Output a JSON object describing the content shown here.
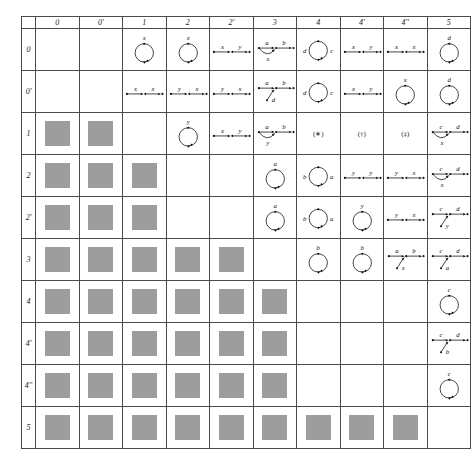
{
  "figure": {
    "kind": "quiver-classification-table",
    "columns": [
      "0",
      "0'",
      "1",
      "2",
      "2'",
      "3",
      "4",
      "4'",
      "4''",
      "5"
    ],
    "rows": [
      "0",
      "0'",
      "1",
      "2",
      "2'",
      "3",
      "4",
      "4'",
      "4''",
      "5"
    ],
    "colors": {
      "blocked": "#9d9d9d",
      "ink": "#111111",
      "rule": "#4b4b4b"
    },
    "legend": {
      "blocked": "gray filled square (no diagram)",
      "loop": "circle with arrowhead and edge label",
      "chain": "horizontal arrow chain with edge labels",
      "chain_arc": "arrow chain with lower arc edge",
      "chain_branch": "arrow chain with diagonal branch edge"
    }
  },
  "cells": {
    "0": {
      "0": {
        "type": "blank"
      },
      "0'": {
        "type": "blank"
      },
      "1": {
        "type": "loop",
        "labels": [
          "x"
        ]
      },
      "2": {
        "type": "loop",
        "labels": [
          "x"
        ]
      },
      "2'": {
        "type": "chain",
        "labels": [
          "x",
          "y"
        ]
      },
      "3": {
        "type": "chain_arc",
        "labels": [
          "a",
          "b"
        ],
        "arc_label": "x"
      },
      "4": {
        "type": "loop_two",
        "labels": [
          "d",
          "c"
        ]
      },
      "4'": {
        "type": "chain",
        "labels": [
          "x",
          "y"
        ]
      },
      "4''": {
        "type": "chain",
        "labels": [
          "x",
          "x"
        ]
      },
      "5": {
        "type": "loop",
        "labels": [
          "d"
        ]
      }
    },
    "0'": {
      "0": {
        "type": "blank"
      },
      "0'": {
        "type": "blank"
      },
      "1": {
        "type": "chain",
        "labels": [
          "x",
          "x"
        ]
      },
      "2": {
        "type": "chain",
        "labels": [
          "y",
          "x"
        ]
      },
      "2'": {
        "type": "chain",
        "labels": [
          "y",
          "x"
        ]
      },
      "3": {
        "type": "chain_branch",
        "labels": [
          "a",
          "b"
        ],
        "branch_label": "d"
      },
      "4": {
        "type": "loop_two",
        "labels": [
          "d",
          "c"
        ]
      },
      "4'": {
        "type": "chain",
        "labels": [
          "x",
          "y"
        ]
      },
      "4''": {
        "type": "loop",
        "labels": [
          "x"
        ]
      },
      "5": {
        "type": "loop",
        "labels": [
          "d"
        ]
      }
    },
    "1": {
      "0": {
        "type": "blocked"
      },
      "0'": {
        "type": "blocked"
      },
      "1": {
        "type": "blank"
      },
      "2": {
        "type": "loop",
        "labels": [
          "y"
        ]
      },
      "2'": {
        "type": "chain",
        "labels": [
          "x",
          "y"
        ]
      },
      "3": {
        "type": "chain_arc",
        "labels": [
          "a",
          "b"
        ],
        "arc_label": "y"
      },
      "4": {
        "type": "marker",
        "text": "(∗)"
      },
      "4'": {
        "type": "marker",
        "text": "(†)"
      },
      "4''": {
        "type": "marker",
        "text": "(‡)"
      },
      "5": {
        "type": "chain_arc",
        "labels": [
          "c",
          "d"
        ],
        "arc_label": "x"
      }
    },
    "2": {
      "0": {
        "type": "blocked"
      },
      "0'": {
        "type": "blocked"
      },
      "1": {
        "type": "blocked"
      },
      "2": {
        "type": "blank"
      },
      "2'": {
        "type": "blank"
      },
      "3": {
        "type": "loop",
        "labels": [
          "a"
        ]
      },
      "4": {
        "type": "loop_two",
        "labels": [
          "b",
          "a"
        ]
      },
      "4'": {
        "type": "chain",
        "labels": [
          "y",
          "y"
        ]
      },
      "4''": {
        "type": "chain",
        "labels": [
          "y",
          "x"
        ]
      },
      "5": {
        "type": "chain_arc",
        "labels": [
          "c",
          "d"
        ],
        "arc_label": "x"
      }
    },
    "2'": {
      "0": {
        "type": "blocked"
      },
      "0'": {
        "type": "blocked"
      },
      "1": {
        "type": "blocked"
      },
      "2": {
        "type": "blank"
      },
      "2'": {
        "type": "blank"
      },
      "3": {
        "type": "loop",
        "labels": [
          "a"
        ]
      },
      "4": {
        "type": "loop_two",
        "labels": [
          "b",
          "a"
        ]
      },
      "4'": {
        "type": "loop",
        "labels": [
          "y"
        ]
      },
      "4''": {
        "type": "chain",
        "labels": [
          "y",
          "x"
        ]
      },
      "5": {
        "type": "chain_branch",
        "labels": [
          "c",
          "d"
        ],
        "branch_label": "y"
      }
    },
    "3": {
      "0": {
        "type": "blocked"
      },
      "0'": {
        "type": "blocked"
      },
      "1": {
        "type": "blocked"
      },
      "2": {
        "type": "blocked"
      },
      "2'": {
        "type": "blocked"
      },
      "3": {
        "type": "blank"
      },
      "4": {
        "type": "loop",
        "labels": [
          "b"
        ]
      },
      "4'": {
        "type": "loop",
        "labels": [
          "b"
        ]
      },
      "4''": {
        "type": "chain_branch",
        "labels": [
          "a",
          "b"
        ],
        "branch_label": "x"
      },
      "5": {
        "type": "chain_branch",
        "labels": [
          "c",
          "d"
        ],
        "branch_label": "a"
      }
    },
    "4": {
      "0": {
        "type": "blocked"
      },
      "0'": {
        "type": "blocked"
      },
      "1": {
        "type": "blocked"
      },
      "2": {
        "type": "blocked"
      },
      "2'": {
        "type": "blocked"
      },
      "3": {
        "type": "blocked"
      },
      "4": {
        "type": "blank"
      },
      "4'": {
        "type": "blank"
      },
      "4''": {
        "type": "blank"
      },
      "5": {
        "type": "loop",
        "labels": [
          "c"
        ]
      }
    },
    "4'": {
      "0": {
        "type": "blocked"
      },
      "0'": {
        "type": "blocked"
      },
      "1": {
        "type": "blocked"
      },
      "2": {
        "type": "blocked"
      },
      "2'": {
        "type": "blocked"
      },
      "3": {
        "type": "blocked"
      },
      "4": {
        "type": "blank"
      },
      "4'": {
        "type": "blank"
      },
      "4''": {
        "type": "blank"
      },
      "5": {
        "type": "chain_branch",
        "labels": [
          "c",
          "d"
        ],
        "branch_label": "b"
      }
    },
    "4''": {
      "0": {
        "type": "blocked"
      },
      "0'": {
        "type": "blocked"
      },
      "1": {
        "type": "blocked"
      },
      "2": {
        "type": "blocked"
      },
      "2'": {
        "type": "blocked"
      },
      "3": {
        "type": "blocked"
      },
      "4": {
        "type": "blank"
      },
      "4'": {
        "type": "blank"
      },
      "4''": {
        "type": "blank"
      },
      "5": {
        "type": "loop",
        "labels": [
          "c"
        ]
      }
    },
    "5": {
      "0": {
        "type": "blocked"
      },
      "0'": {
        "type": "blocked"
      },
      "1": {
        "type": "blocked"
      },
      "2": {
        "type": "blocked"
      },
      "2'": {
        "type": "blocked"
      },
      "3": {
        "type": "blocked"
      },
      "4": {
        "type": "blocked"
      },
      "4'": {
        "type": "blocked"
      },
      "4''": {
        "type": "blocked"
      },
      "5": {
        "type": "blank"
      }
    }
  }
}
